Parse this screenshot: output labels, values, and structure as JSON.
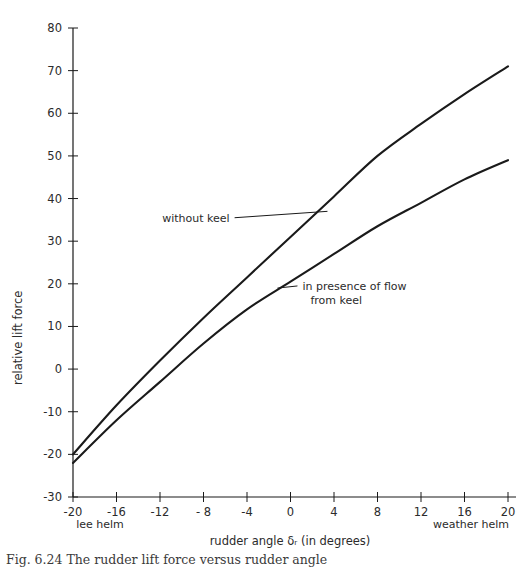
{
  "figure": {
    "caption": "Fig. 6.24 The rudder lift force versus rudder angle",
    "background": "#ffffff",
    "line_color": "#1a1a1a"
  },
  "chart_data": {
    "type": "line",
    "title": "",
    "xlabel": "rudder angle  δᵣ  (in degrees)",
    "ylabel": "relative lift force",
    "xlim": [
      -20,
      20
    ],
    "ylim": [
      -30,
      80
    ],
    "grid": false,
    "legend": "inline-annotations",
    "xticks": [
      -20,
      -16,
      -12,
      -8,
      -4,
      0,
      4,
      8,
      12,
      16,
      20
    ],
    "xtick_labels": [
      "-20",
      "-16",
      "-12",
      "- 8",
      "-4",
      "0",
      "4",
      "8",
      "12",
      "16",
      "20"
    ],
    "yticks": [
      -30,
      -20,
      -10,
      0,
      10,
      20,
      30,
      40,
      50,
      60,
      70,
      80
    ],
    "ytick_labels": [
      "-30",
      "-20",
      "-10",
      "0",
      "10",
      "20",
      "30",
      "40",
      "50",
      "60",
      "70",
      "80"
    ],
    "x_axis_end_labels": {
      "left": "lee helm",
      "right": "weather helm"
    },
    "annotations": [
      {
        "text": "without keel",
        "series": "without keel",
        "text_x": -5.6,
        "text_y": 35.5,
        "leader_to_x": 3.4,
        "leader_to_y": 37.0
      },
      {
        "text_line1": "in presence of flow",
        "text_line2": "from keel",
        "series": "in presence of flow from keel",
        "text_x": 1.1,
        "text_y": 19.5,
        "leader_to_x": -1.2,
        "leader_to_y": 19.0
      }
    ],
    "x": [
      -20,
      -16,
      -12,
      -8,
      -4,
      0,
      4,
      8,
      12,
      16,
      20
    ],
    "series": [
      {
        "name": "without keel",
        "values": [
          -20.0,
          -8.5,
          2.0,
          12.0,
          21.5,
          31.0,
          40.5,
          50.0,
          57.5,
          64.5,
          71.0
        ]
      },
      {
        "name": "in presence of flow from keel",
        "values": [
          -22.0,
          -12.0,
          -3.0,
          6.0,
          14.0,
          20.5,
          27.0,
          33.5,
          39.0,
          44.5,
          49.0
        ]
      }
    ]
  }
}
